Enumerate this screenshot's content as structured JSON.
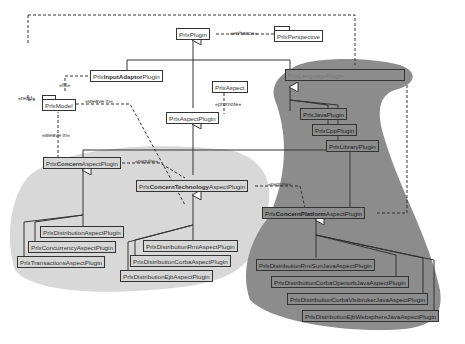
{
  "diagram": {
    "type": "uml-class-diagram",
    "nodes": {
      "plugin": "PrlxPlugin",
      "perspective": "PrlxPerspective",
      "input_adaptor_pre": "Prlx",
      "input_adaptor_bold": "InputAdaptor",
      "input_adaptor_post": "Plugin",
      "model": "PrlxModel",
      "aspect": "PrlxAspect",
      "aspect_plugin": "PrlxAspectPlugin",
      "language_plugin": "PrlxLanguagePlugin",
      "java_plugin": "PrlxJavaPlugin",
      "cpp_plugin": "PrlxCppPlugin",
      "library_plugin": "PrlxLibraryPlugin",
      "concern_pre": "Prlx",
      "concern_bold": "Concern",
      "concern_post": "AspectPlugin",
      "tech_pre": "Prlx",
      "tech_bold": "ConcernTechnology",
      "tech_post": "AspectPlugin",
      "platform_pre": "Prlx",
      "platform_bold": "ConcernPlatform",
      "platform_post": "AspectPlugin",
      "distribution": "PrlxDistributionAspectPlugin",
      "concurrency": "PrlxConcurrencyAspectPlugin",
      "transactions": "PrlxTransactionsAspectPlugin",
      "dist_rmi": "PrlxDistributionRmiAspectPlugin",
      "dist_corba": "PrlxDistributionCorbaAspectPlugin",
      "dist_ejb": "PrlxDistributionEjbAspectPlugin",
      "rmi_sun_java": "PrlxDistributionRmiSunJavaAspectPlugin",
      "corba_openorb_java": "PrlxDistributionCorbaOpenorbJavaAspectPlugin",
      "corba_visibroker_java": "PrlxDistributionCorbaVisibrokerJavaAspectPlugin",
      "ejb_websphere_java": "PrlxDistributionEjbWebsphereJavaAspectPlugin"
    },
    "labels": {
      "enhance": "«enhance»",
      "read": "«read»",
      "fill": "«fill»",
      "weave_in_1": "«weave in»",
      "weave_in_2": "«weave in»",
      "promote": "«promote»",
      "require_1": "«require»",
      "require_2": "«require»"
    },
    "colors": {
      "light_region": "#d8d8d8",
      "dark_region": "#8c8c8c",
      "line": "#333333"
    }
  }
}
